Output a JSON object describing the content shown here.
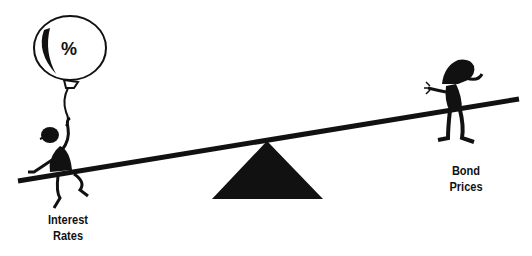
{
  "diagram": {
    "type": "seesaw-illustration",
    "balloon_symbol": "%",
    "left_label": [
      "Interest",
      "Rates"
    ],
    "right_label": [
      "Bond",
      "Prices"
    ],
    "colors": {
      "ink": "#111111",
      "background": "#ffffff"
    }
  }
}
